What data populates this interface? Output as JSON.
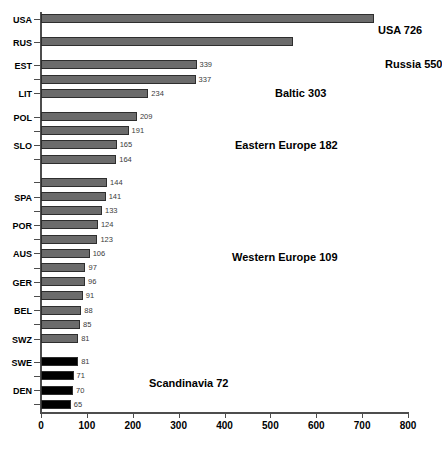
{
  "chart_data": {
    "type": "bar",
    "orientation": "horizontal",
    "title": "",
    "xlabel": "",
    "ylabel": "",
    "xlim": [
      0,
      800
    ],
    "xticks": [
      0,
      100,
      200,
      300,
      400,
      500,
      600,
      700,
      800
    ],
    "grid": false,
    "legend": "none",
    "categories": [
      "USA",
      "RUS",
      "EST",
      "LIT",
      "POL",
      "SLO",
      "SPA",
      "POR",
      "AUS",
      "GER",
      "BEL",
      "SWZ",
      "SWE",
      "DEN"
    ],
    "bars": [
      {
        "label": "USA",
        "value": 726,
        "color": "#6b6b6b",
        "value_shown": "",
        "tick_label": "USA"
      },
      {
        "label": "RUS",
        "value": 550,
        "color": "#6b6b6b",
        "value_shown": "",
        "tick_label": "RUS"
      },
      {
        "label": "EST",
        "value": 339,
        "color": "#6b6b6b",
        "value_shown": "339",
        "tick_label": "EST"
      },
      {
        "label": "LAT",
        "value": 337,
        "color": "#6b6b6b",
        "value_shown": "337",
        "tick_label": ""
      },
      {
        "label": "LIT",
        "value": 234,
        "color": "#6b6b6b",
        "value_shown": "234",
        "tick_label": "LIT"
      },
      {
        "label": "POL",
        "value": 209,
        "color": "#6b6b6b",
        "value_shown": "209",
        "tick_label": "POL"
      },
      {
        "label": "E2",
        "value": 191,
        "color": "#6b6b6b",
        "value_shown": "191",
        "tick_label": ""
      },
      {
        "label": "SLO",
        "value": 165,
        "color": "#6b6b6b",
        "value_shown": "165",
        "tick_label": "SLO"
      },
      {
        "label": "E4",
        "value": 164,
        "color": "#6b6b6b",
        "value_shown": "164",
        "tick_label": ""
      },
      {
        "label": "W1",
        "value": 144,
        "color": "#6b6b6b",
        "value_shown": "144",
        "tick_label": ""
      },
      {
        "label": "SPA",
        "value": 141,
        "color": "#6b6b6b",
        "value_shown": "141",
        "tick_label": "SPA"
      },
      {
        "label": "W3",
        "value": 133,
        "color": "#6b6b6b",
        "value_shown": "133",
        "tick_label": ""
      },
      {
        "label": "POR",
        "value": 124,
        "color": "#6b6b6b",
        "value_shown": "124",
        "tick_label": "POR"
      },
      {
        "label": "W5",
        "value": 123,
        "color": "#6b6b6b",
        "value_shown": "123",
        "tick_label": ""
      },
      {
        "label": "AUS",
        "value": 106,
        "color": "#6b6b6b",
        "value_shown": "106",
        "tick_label": "AUS"
      },
      {
        "label": "W7",
        "value": 97,
        "color": "#6b6b6b",
        "value_shown": "97",
        "tick_label": ""
      },
      {
        "label": "GER",
        "value": 96,
        "color": "#6b6b6b",
        "value_shown": "96",
        "tick_label": "GER"
      },
      {
        "label": "W9",
        "value": 91,
        "color": "#6b6b6b",
        "value_shown": "91",
        "tick_label": ""
      },
      {
        "label": "BEL",
        "value": 88,
        "color": "#6b6b6b",
        "value_shown": "88",
        "tick_label": "BEL"
      },
      {
        "label": "W11",
        "value": 85,
        "color": "#6b6b6b",
        "value_shown": "85",
        "tick_label": ""
      },
      {
        "label": "SWZ",
        "value": 81,
        "color": "#6b6b6b",
        "value_shown": "81",
        "tick_label": "SWZ"
      },
      {
        "label": "SWE",
        "value": 81,
        "color": "#000000",
        "value_shown": "81",
        "tick_label": "SWE"
      },
      {
        "label": "S2",
        "value": 71,
        "color": "#000000",
        "value_shown": "71",
        "tick_label": ""
      },
      {
        "label": "DEN",
        "value": 70,
        "color": "#000000",
        "value_shown": "70",
        "tick_label": "DEN"
      },
      {
        "label": "S4",
        "value": 65,
        "color": "#000000",
        "value_shown": "65",
        "tick_label": ""
      }
    ],
    "annotations": [
      {
        "text": "USA 726",
        "x_px": 378,
        "y_px": 24
      },
      {
        "text": "Russia 550",
        "x_px": 385,
        "y_px": 58
      },
      {
        "text": "Baltic 303",
        "x_px": 275,
        "y_px": 87
      },
      {
        "text": "Eastern Europe 182",
        "x_px": 235,
        "y_px": 139
      },
      {
        "text": "Western Europe 109",
        "x_px": 232,
        "y_px": 251
      },
      {
        "text": "Scandinavia 72",
        "x_px": 149,
        "y_px": 377
      }
    ],
    "group_gaps_after": [
      "USA",
      "RUS",
      "LIT",
      "E4",
      "SWZ"
    ],
    "colors": {
      "gray_bar": "#6b6b6b",
      "black_bar": "#000000",
      "axis": "#4d4d4d",
      "value_text": "#3a3a3a"
    }
  }
}
